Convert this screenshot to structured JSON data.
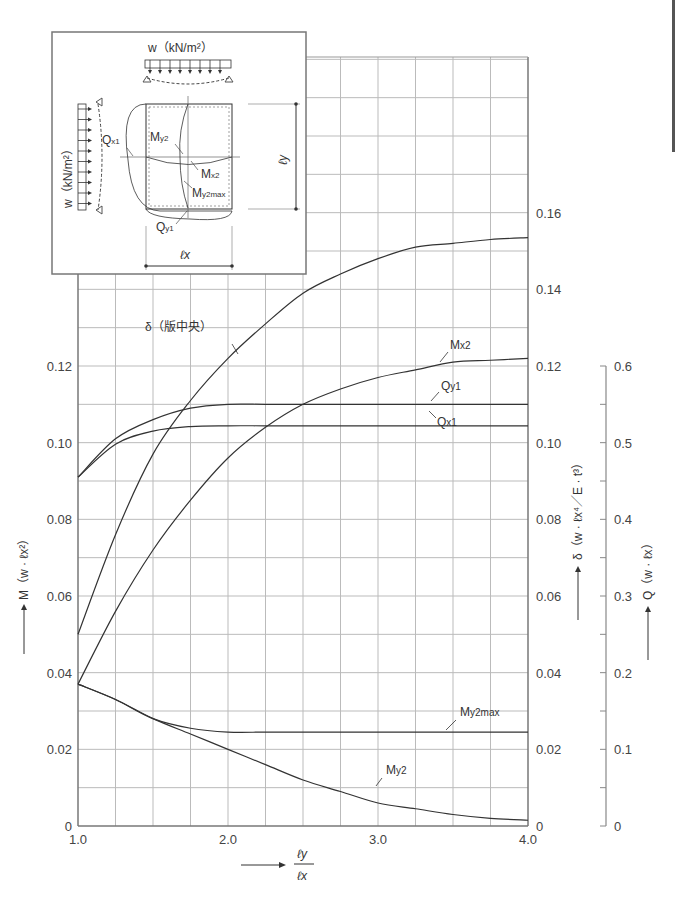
{
  "chart_data": {
    "type": "line",
    "title": "",
    "xlabel": "ℓy / ℓx",
    "x_tick_labels": [
      "1.0",
      "2.0",
      "3.0",
      "4.0"
    ],
    "xlim": [
      1.0,
      4.0
    ],
    "x_grid_step": 0.25,
    "axes": {
      "left": {
        "label": "M (w · ℓx²)",
        "ticks": [
          "0",
          "0.02",
          "0.04",
          "0.06",
          "0.08",
          "0.10",
          "0.12"
        ],
        "ylim": [
          0,
          0.12
        ]
      },
      "right_inner": {
        "label": "δ (w · ℓx⁴ / E · t³)",
        "ticks": [
          "0",
          "0.02",
          "0.04",
          "0.06",
          "0.08",
          "0.10",
          "0.12",
          "0.14",
          "0.16"
        ],
        "ylim": [
          0,
          0.16
        ]
      },
      "right_outer": {
        "label": "Q (w · ℓx)",
        "ticks": [
          "0",
          "0.1",
          "0.2",
          "0.3",
          "0.4",
          "0.5",
          "0.6"
        ],
        "ylim": [
          0,
          0.6
        ]
      }
    },
    "grid": true,
    "x": [
      1.0,
      1.25,
      1.5,
      1.75,
      2.0,
      2.25,
      2.5,
      2.75,
      3.0,
      3.25,
      3.5,
      3.75,
      4.0
    ],
    "series": [
      {
        "name": "δ（版中央）",
        "axis": "right_inner",
        "values": [
          0.05,
          0.076,
          0.097,
          0.111,
          0.122,
          0.131,
          0.139,
          0.144,
          0.148,
          0.151,
          0.152,
          0.153,
          0.1535
        ]
      },
      {
        "name": "Mx2",
        "axis": "left",
        "values": [
          0.037,
          0.056,
          0.072,
          0.085,
          0.096,
          0.104,
          0.11,
          0.114,
          0.117,
          0.119,
          0.121,
          0.1215,
          0.122
        ]
      },
      {
        "name": "Qy1",
        "axis": "right_outer",
        "values": [
          0.455,
          0.505,
          0.53,
          0.545,
          0.55,
          0.55,
          0.55,
          0.55,
          0.55,
          0.55,
          0.55,
          0.55,
          0.55
        ]
      },
      {
        "name": "Qx1",
        "axis": "right_outer",
        "values": [
          0.455,
          0.498,
          0.515,
          0.521,
          0.522,
          0.522,
          0.522,
          0.522,
          0.522,
          0.522,
          0.522,
          0.522,
          0.522
        ]
      },
      {
        "name": "My2max",
        "axis": "left",
        "values": [
          0.037,
          0.033,
          0.028,
          0.0255,
          0.0245,
          0.0245,
          0.0245,
          0.0245,
          0.0245,
          0.0245,
          0.0245,
          0.0245,
          0.0245
        ]
      },
      {
        "name": "My2",
        "axis": "left",
        "values": [
          0.037,
          0.033,
          0.028,
          0.024,
          0.02,
          0.016,
          0.012,
          0.009,
          0.006,
          0.0045,
          0.003,
          0.002,
          0.0015
        ]
      }
    ],
    "annotations": [
      "δ（版中央）",
      "Mx2",
      "Qy1",
      "Qx1",
      "My2max",
      "My2"
    ],
    "inset": {
      "load_top": "w（kN/m²）",
      "load_left": "w（kN/m²）",
      "labels": [
        "Qx1",
        "My2",
        "Mx2",
        "My2max",
        "Qy1",
        "ℓx",
        "ℓy"
      ]
    }
  }
}
